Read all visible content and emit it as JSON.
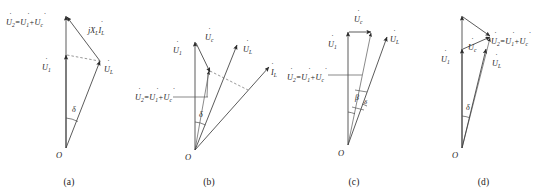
{
  "figure": {
    "type": "phasor-diagram-set",
    "panel_count": 4,
    "background": "#ffffff",
    "line_color": "#3d3d3d",
    "text_color": "#262626"
  },
  "panels": [
    {
      "id": "a",
      "caption": "(a)",
      "origin_label": "O",
      "angle_labels": [
        {
          "name": "delta",
          "text": "δ"
        }
      ],
      "labels": [
        {
          "name": "u2-sum",
          "base": "U",
          "dot": true,
          "sub": "2",
          "text": "Ü2=Ü1+Üc",
          "parts": [
            {
              "sym": "U",
              "sub": "2"
            },
            {
              "op": "="
            },
            {
              "sym": "U",
              "sub": "1"
            },
            {
              "op": "+"
            },
            {
              "sym": "U",
              "sub": "c"
            }
          ]
        },
        {
          "name": "u1",
          "text": "Ü1",
          "parts": [
            {
              "sym": "U",
              "sub": "1"
            }
          ]
        },
        {
          "name": "ul",
          "text": "ÜL",
          "parts": [
            {
              "sym": "U",
              "sub": "L"
            }
          ]
        },
        {
          "name": "jxl-il",
          "text": "jXL·ÏL",
          "parts": [
            {
              "sym": "j",
              "sub": ""
            },
            {
              "sym": "X",
              "sub": "L"
            },
            {
              "sym": "I",
              "sub": "L"
            }
          ]
        }
      ]
    },
    {
      "id": "b",
      "caption": "(b)",
      "origin_label": "O",
      "angle_labels": [
        {
          "name": "delta",
          "text": "δ"
        }
      ],
      "labels": [
        {
          "name": "u1",
          "text": "Ü1",
          "parts": [
            {
              "sym": "U",
              "sub": "1"
            }
          ]
        },
        {
          "name": "uc",
          "text": "Üc",
          "parts": [
            {
              "sym": "U",
              "sub": "c"
            }
          ]
        },
        {
          "name": "ul",
          "text": "ÜL",
          "parts": [
            {
              "sym": "U",
              "sub": "L"
            }
          ]
        },
        {
          "name": "il",
          "text": "ÏL",
          "parts": [
            {
              "sym": "I",
              "sub": "L"
            }
          ]
        },
        {
          "name": "u2-sum",
          "text": "Ü2=Ü1+Üc",
          "parts": [
            {
              "sym": "U",
              "sub": "2"
            },
            {
              "op": "="
            },
            {
              "sym": "U",
              "sub": "1"
            },
            {
              "op": "+"
            },
            {
              "sym": "U",
              "sub": "c"
            }
          ]
        }
      ]
    },
    {
      "id": "c",
      "caption": "(c)",
      "origin_label": "O",
      "angle_labels": [
        {
          "name": "beta",
          "text": "β"
        },
        {
          "name": "delta",
          "text": "δ"
        }
      ],
      "labels": [
        {
          "name": "uc",
          "text": "Üc",
          "parts": [
            {
              "sym": "U",
              "sub": "c"
            }
          ]
        },
        {
          "name": "u1",
          "text": "Ü1",
          "parts": [
            {
              "sym": "U",
              "sub": "1"
            }
          ]
        },
        {
          "name": "ul",
          "text": "ÜL",
          "parts": [
            {
              "sym": "U",
              "sub": "L"
            }
          ]
        },
        {
          "name": "u2-sum",
          "text": "Ü2=Ü1+Üc",
          "parts": [
            {
              "sym": "U",
              "sub": "2"
            },
            {
              "op": "="
            },
            {
              "sym": "U",
              "sub": "1"
            },
            {
              "op": "+"
            },
            {
              "sym": "U",
              "sub": "c"
            }
          ]
        }
      ]
    },
    {
      "id": "d",
      "caption": "(d)",
      "origin_label": "O",
      "angle_labels": [
        {
          "name": "delta",
          "text": "δ"
        }
      ],
      "labels": [
        {
          "name": "u1",
          "text": "Ü1",
          "parts": [
            {
              "sym": "U",
              "sub": "1"
            }
          ]
        },
        {
          "name": "uc",
          "text": "Üc",
          "parts": [
            {
              "sym": "U",
              "sub": "c"
            }
          ]
        },
        {
          "name": "u2-sum",
          "text": "Ü2=Ü1+Üc",
          "parts": [
            {
              "sym": "U",
              "sub": "2"
            },
            {
              "op": "="
            },
            {
              "sym": "U",
              "sub": "1"
            },
            {
              "op": "+"
            },
            {
              "sym": "U",
              "sub": "c"
            }
          ]
        },
        {
          "name": "ul",
          "text": "ÜL",
          "parts": [
            {
              "sym": "U",
              "sub": "L"
            }
          ]
        }
      ]
    }
  ],
  "symbols": {
    "U": "U",
    "I": "I",
    "X": "X",
    "j": "j",
    "eq": "=",
    "plus": "+",
    "dot_accent": "̇",
    "delta": "δ",
    "beta": "β",
    "origin": "O",
    "sub_1": "1",
    "sub_2": "2",
    "sub_c": "c",
    "sub_L": "L"
  },
  "captions": {
    "a": "(a)",
    "b": "(b)",
    "c": "(c)",
    "d": "(d)"
  }
}
